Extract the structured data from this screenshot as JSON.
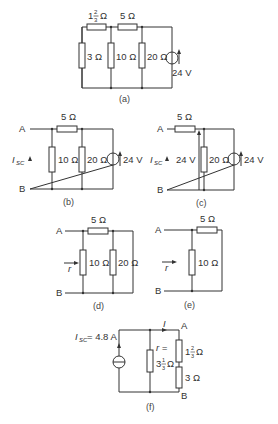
{
  "diagram": {
    "a": {
      "caption": "(a)",
      "r1": "1⅔ Ω",
      "r1_whole": "1",
      "r1_num": "2",
      "r1_den": "3",
      "r2": "5 Ω",
      "r3": "3 Ω",
      "r4": "10 Ω",
      "r5": "20 Ω",
      "source": "24 V"
    },
    "b": {
      "caption": "(b)",
      "node_a": "A",
      "node_b": "B",
      "isc": "I",
      "isc_sub": "SC",
      "r_series": "5 Ω",
      "r_mid": "10 Ω",
      "r_right": "20 Ω",
      "source": "24 V"
    },
    "c": {
      "caption": "(c)",
      "node_a": "A",
      "node_b": "B",
      "isc": "I",
      "isc_sub": "SC",
      "r_series": "5 Ω",
      "v_mid": "24 V",
      "r_right": "20 Ω",
      "source": "24 V"
    },
    "d": {
      "caption": "(d)",
      "node_a": "A",
      "node_b": "B",
      "r_label": "r",
      "r_series": "5 Ω",
      "r_mid": "10 Ω",
      "r_right": "20 Ω"
    },
    "e": {
      "caption": "(e)",
      "node_a": "A",
      "node_b": "B",
      "r_label": "r",
      "r_series": "5 Ω",
      "r_mid": "10 Ω"
    },
    "f": {
      "caption": "(f)",
      "node_a": "A",
      "node_b": "B",
      "isc": "I",
      "isc_sub": "SC",
      "isc_value": "= 4.8 A",
      "current": "I",
      "r_label": "r =",
      "r_whole": "3",
      "r_num": "1",
      "r_den": "3",
      "r_unit": "Ω",
      "r1_whole": "1",
      "r1_num": "2",
      "r1_den": "3",
      "r1_unit": "Ω",
      "r2": "3 Ω"
    }
  }
}
